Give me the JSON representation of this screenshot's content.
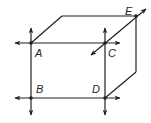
{
  "diagram": {
    "type": "rectangular prism with lines through vertices",
    "stroke_color": "#231f20",
    "background": "#ffffff",
    "points": [
      {
        "label": "A",
        "x": 31,
        "y": 43
      },
      {
        "label": "C",
        "x": 105,
        "y": 43
      },
      {
        "label": "B",
        "x": 31,
        "y": 98
      },
      {
        "label": "D",
        "x": 105,
        "y": 98
      },
      {
        "label": "E",
        "x": 136,
        "y": 16
      }
    ],
    "labels": {
      "A": "A",
      "B": "B",
      "C": "C",
      "D": "D",
      "E": "E"
    }
  }
}
